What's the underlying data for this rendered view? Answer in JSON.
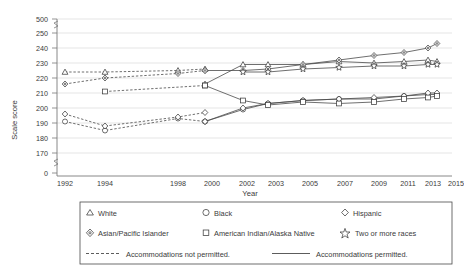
{
  "chart_data": {
    "type": "line",
    "title": "",
    "xlabel": "Year",
    "ylabel": "Scale score",
    "grid": true,
    "legend_position": "bottom",
    "x": [
      1992,
      1994,
      1998,
      2000,
      2002,
      2003,
      2005,
      2007,
      2009,
      2011,
      2013,
      2015
    ],
    "x_tick_labels": [
      "1992",
      "1994",
      "1998",
      "2000",
      "2002",
      "2003",
      "2005",
      "2007",
      "2009",
      "2011",
      "2013",
      "2015"
    ],
    "y_tick_labels": [
      "0",
      "170",
      "180",
      "190",
      "200",
      "210",
      "220",
      "230",
      "240",
      "250",
      "500"
    ],
    "y_axis_note": "axis broken between 0 and 170, and between 250 and 500",
    "ylim": [
      165,
      255
    ],
    "series": [
      {
        "name": "White",
        "accommodations": "not permitted",
        "marker": "triangle",
        "style": "dashed",
        "points": [
          [
            1992,
            224
          ],
          [
            1994,
            224
          ],
          [
            1998,
            225
          ],
          [
            2000,
            226
          ]
        ]
      },
      {
        "name": "White",
        "accommodations": "permitted",
        "marker": "triangle",
        "style": "solid",
        "points": [
          [
            2000,
            216
          ],
          [
            2002,
            229
          ],
          [
            2003,
            229
          ],
          [
            2005,
            229
          ],
          [
            2007,
            231
          ],
          [
            2009,
            230
          ],
          [
            2011,
            231
          ],
          [
            2013,
            232
          ],
          [
            2015,
            231
          ]
        ]
      },
      {
        "name": "Black",
        "accommodations": "not permitted",
        "marker": "circle",
        "style": "dashed",
        "points": [
          [
            1992,
            191
          ],
          [
            1994,
            185
          ],
          [
            1998,
            193
          ],
          [
            2000,
            191
          ]
        ]
      },
      {
        "name": "Black",
        "accommodations": "permitted",
        "marker": "circle",
        "style": "solid",
        "points": [
          [
            2000,
            191
          ],
          [
            2002,
            199
          ],
          [
            2003,
            203
          ],
          [
            2005,
            205
          ],
          [
            2007,
            206
          ],
          [
            2009,
            206
          ],
          [
            2011,
            208
          ],
          [
            2013,
            209
          ],
          [
            2015,
            209
          ]
        ]
      },
      {
        "name": "Hispanic",
        "accommodations": "not permitted",
        "marker": "diamond",
        "style": "dashed",
        "points": [
          [
            1992,
            196
          ],
          [
            1994,
            188
          ],
          [
            1998,
            194
          ],
          [
            2000,
            197
          ]
        ]
      },
      {
        "name": "Hispanic",
        "accommodations": "permitted",
        "marker": "diamond",
        "style": "solid",
        "points": [
          [
            2000,
            191
          ],
          [
            2002,
            200
          ],
          [
            2003,
            203
          ],
          [
            2005,
            205
          ],
          [
            2007,
            206
          ],
          [
            2009,
            207
          ],
          [
            2011,
            208
          ],
          [
            2013,
            210
          ],
          [
            2015,
            210
          ]
        ]
      },
      {
        "name": "Asian/Pacific Islander",
        "accommodations": "not permitted",
        "marker": "diamond-open",
        "style": "dashed",
        "points": [
          [
            1992,
            216
          ],
          [
            1994,
            220
          ],
          [
            1998,
            223
          ],
          [
            2000,
            225
          ]
        ]
      },
      {
        "name": "Asian/Pacific Islander",
        "accommodations": "permitted",
        "marker": "diamond-open",
        "style": "solid",
        "points": [
          [
            2000,
            225
          ],
          [
            2002,
            225
          ],
          [
            2003,
            226
          ],
          [
            2005,
            229
          ],
          [
            2007,
            232
          ],
          [
            2009,
            235
          ],
          [
            2011,
            237
          ],
          [
            2013,
            240
          ],
          [
            2015,
            243
          ]
        ]
      },
      {
        "name": "American Indian/Alaska Native",
        "accommodations": "not permitted",
        "marker": "square",
        "style": "dashed",
        "points": [
          [
            1994,
            211
          ],
          [
            2000,
            215
          ]
        ]
      },
      {
        "name": "American Indian/Alaska Native",
        "accommodations": "permitted",
        "marker": "square",
        "style": "solid",
        "points": [
          [
            2000,
            215
          ],
          [
            2002,
            205
          ],
          [
            2003,
            202
          ],
          [
            2005,
            204
          ],
          [
            2007,
            203
          ],
          [
            2009,
            204
          ],
          [
            2011,
            206
          ],
          [
            2013,
            207
          ],
          [
            2015,
            208
          ]
        ]
      },
      {
        "name": "Two or more races",
        "accommodations": "permitted",
        "marker": "star",
        "style": "solid",
        "points": [
          [
            2002,
            224
          ],
          [
            2003,
            224
          ],
          [
            2005,
            226
          ],
          [
            2007,
            227
          ],
          [
            2009,
            228
          ],
          [
            2011,
            228
          ],
          [
            2013,
            229
          ],
          [
            2015,
            229
          ]
        ]
      }
    ]
  },
  "legend": {
    "entries": [
      {
        "label": "White",
        "marker": "triangle"
      },
      {
        "label": "Black",
        "marker": "circle"
      },
      {
        "label": "Hispanic",
        "marker": "diamond"
      },
      {
        "label": "Asian/Pacific Islander",
        "marker": "diamond-open"
      },
      {
        "label": "American Indian/Alaska Native",
        "marker": "square"
      },
      {
        "label": "Two or more races",
        "marker": "star"
      }
    ],
    "style_entries": [
      {
        "label": "Accommodations not permitted.",
        "style": "dashed"
      },
      {
        "label": "Accommodations permitted.",
        "style": "solid"
      }
    ]
  }
}
